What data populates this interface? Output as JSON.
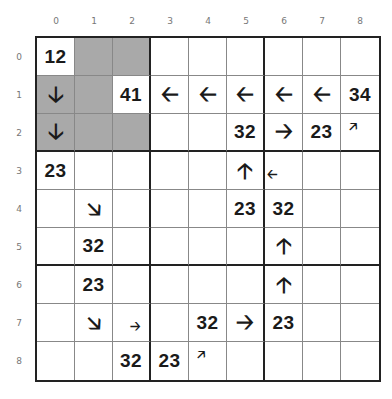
{
  "column_labels": [
    "0",
    "1",
    "2",
    "3",
    "4",
    "5",
    "6",
    "7",
    "8"
  ],
  "row_labels": [
    "0",
    "1",
    "2",
    "3",
    "4",
    "5",
    "6",
    "7",
    "8"
  ],
  "colors": {
    "shaded": "#a9a9a9",
    "grid_line": "#888888",
    "thick_line": "#222222",
    "text": "#1a1a1a"
  },
  "cells": [
    {
      "r": 0,
      "c": 0,
      "type": "number",
      "text": "12"
    },
    {
      "r": 0,
      "c": 1,
      "type": "shaded"
    },
    {
      "r": 0,
      "c": 2,
      "type": "shaded"
    },
    {
      "r": 1,
      "c": 0,
      "type": "arrow",
      "text": "🡣",
      "dir": "down",
      "shaded": true
    },
    {
      "r": 1,
      "c": 1,
      "type": "shaded"
    },
    {
      "r": 1,
      "c": 2,
      "type": "number",
      "text": "41"
    },
    {
      "r": 1,
      "c": 3,
      "type": "arrow",
      "text": "🡠",
      "dir": "left"
    },
    {
      "r": 1,
      "c": 4,
      "type": "arrow",
      "text": "🡠",
      "dir": "left"
    },
    {
      "r": 1,
      "c": 5,
      "type": "arrow",
      "text": "🡠",
      "dir": "left"
    },
    {
      "r": 1,
      "c": 6,
      "type": "arrow",
      "text": "🡠",
      "dir": "left"
    },
    {
      "r": 1,
      "c": 7,
      "type": "arrow",
      "text": "🡠",
      "dir": "left"
    },
    {
      "r": 1,
      "c": 8,
      "type": "number",
      "text": "34"
    },
    {
      "r": 2,
      "c": 0,
      "type": "arrow",
      "text": "🡣",
      "dir": "down",
      "shaded": true
    },
    {
      "r": 2,
      "c": 1,
      "type": "shaded"
    },
    {
      "r": 2,
      "c": 2,
      "type": "shaded"
    },
    {
      "r": 2,
      "c": 5,
      "type": "number",
      "text": "32"
    },
    {
      "r": 2,
      "c": 6,
      "type": "arrow",
      "text": "🡢",
      "dir": "right"
    },
    {
      "r": 2,
      "c": 7,
      "type": "number",
      "text": "23"
    },
    {
      "r": 2,
      "c": 8,
      "type": "arrow",
      "text": "🡥",
      "dir": "up-right",
      "size": "small-tl"
    },
    {
      "r": 3,
      "c": 0,
      "type": "number",
      "text": "23"
    },
    {
      "r": 3,
      "c": 5,
      "type": "arrow",
      "text": "🡡",
      "dir": "up"
    },
    {
      "r": 3,
      "c": 6,
      "type": "arrow",
      "text": "🡠",
      "dir": "left",
      "size": "small-l"
    },
    {
      "r": 4,
      "c": 1,
      "type": "arrow",
      "text": "🡦",
      "dir": "down-right"
    },
    {
      "r": 4,
      "c": 5,
      "type": "number",
      "text": "23"
    },
    {
      "r": 4,
      "c": 6,
      "type": "number",
      "text": "32"
    },
    {
      "r": 5,
      "c": 1,
      "type": "number",
      "text": "32"
    },
    {
      "r": 5,
      "c": 6,
      "type": "arrow",
      "text": "🡡",
      "dir": "up"
    },
    {
      "r": 6,
      "c": 1,
      "type": "number",
      "text": "23"
    },
    {
      "r": 6,
      "c": 6,
      "type": "arrow",
      "text": "🡡",
      "dir": "up"
    },
    {
      "r": 7,
      "c": 1,
      "type": "arrow",
      "text": "🡦",
      "dir": "down-right"
    },
    {
      "r": 7,
      "c": 2,
      "type": "arrow",
      "text": "🡢",
      "dir": "right",
      "size": "small-br"
    },
    {
      "r": 7,
      "c": 4,
      "type": "number",
      "text": "32"
    },
    {
      "r": 7,
      "c": 5,
      "type": "arrow",
      "text": "🡢",
      "dir": "right"
    },
    {
      "r": 7,
      "c": 6,
      "type": "number",
      "text": "23"
    },
    {
      "r": 8,
      "c": 2,
      "type": "number",
      "text": "32"
    },
    {
      "r": 8,
      "c": 3,
      "type": "number",
      "text": "23"
    },
    {
      "r": 8,
      "c": 4,
      "type": "arrow",
      "text": "🡥",
      "dir": "up-right",
      "size": "small-tl"
    }
  ]
}
